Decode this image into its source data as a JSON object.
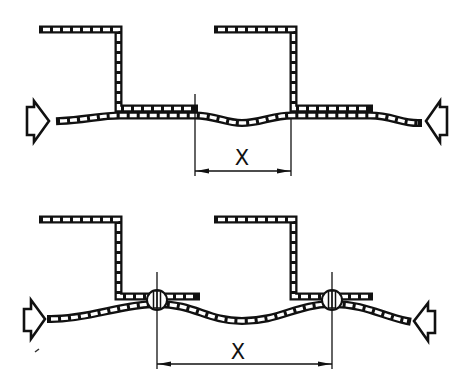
{
  "figure": {
    "type": "technical-cross-section",
    "colors": {
      "ink": "#111111",
      "paper": "#ffffff"
    }
  },
  "top_view": {
    "description": "Two Z-profile stiffeners resting on a wavy skin sheet, compressed from both sides (unattached)",
    "profiles": 2,
    "dimension": {
      "label": "X",
      "from": "end of left profile flange",
      "to": "web of right profile"
    },
    "load_arrows": [
      "arrow-right (left side)",
      "arrow-left (right side)"
    ]
  },
  "bottom_view": {
    "description": "Two Z-profile stiffeners riveted to a buckled skin sheet, compressed from both sides",
    "profiles": 2,
    "rivets": 2,
    "dimension": {
      "label": "X",
      "from": "left rivet centerline",
      "to": "right rivet centerline"
    },
    "load_arrows": [
      "arrow-right (left side)",
      "arrow-left (right side)"
    ]
  }
}
